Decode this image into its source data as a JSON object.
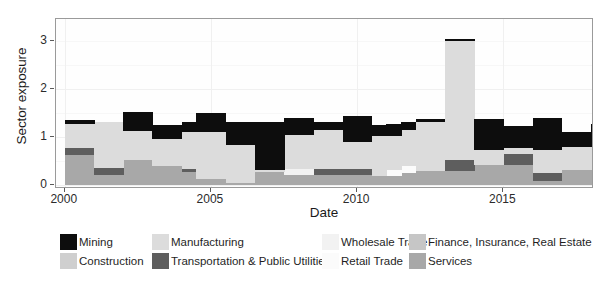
{
  "chart_data": {
    "type": "area",
    "title": "",
    "subtitle": "",
    "xlabel": "Date",
    "ylabel": "Sector exposure",
    "xlim": [
      1999.7,
      2018.1
    ],
    "ylim": [
      -0.08,
      3.45
    ],
    "yticks": [
      0,
      1,
      2,
      3
    ],
    "ytick_labels": [
      "0",
      "1",
      "2",
      "3"
    ],
    "xticks": [
      2000,
      2005,
      2010,
      2015
    ],
    "xtick_labels": [
      "2000",
      "2005",
      "2010",
      "2015"
    ],
    "grid": true,
    "legend_position": "bottom",
    "stacked": true,
    "step_interpolation": "step-post",
    "series": [
      {
        "name": "Services",
        "color": "#a8a8a8",
        "values": [
          0.62,
          0.62,
          0.22,
          0.22,
          0.52,
          0.52,
          0.4,
          0.4,
          0.28,
          0.12,
          0.12,
          0.04,
          0.04,
          0.28,
          0.28,
          0.22,
          0.22,
          0.22,
          0.22,
          0.22,
          0.22,
          0.18,
          0.18,
          0.25,
          0.3,
          0.3,
          0.3,
          0.3,
          0.42,
          0.42,
          0.42,
          0.42,
          0.08,
          0.08,
          0.32,
          0.32,
          0.32,
          0.32
        ]
      },
      {
        "name": "Transportation & Public Utilities",
        "color": "#5e5e5e",
        "values": [
          0.15,
          0.15,
          0.14,
          0.14,
          0.0,
          0.0,
          0.0,
          0.0,
          0.06,
          0.0,
          0.0,
          0.0,
          0.0,
          0.0,
          0.0,
          0.0,
          0.0,
          0.12,
          0.12,
          0.12,
          0.12,
          0.0,
          0.0,
          0.0,
          0.0,
          0.0,
          0.22,
          0.22,
          0.0,
          0.0,
          0.22,
          0.22,
          0.18,
          0.18,
          0.0,
          0.0,
          0.22,
          0.22
        ]
      },
      {
        "name": "Retail Trade",
        "color": "#fbfbfb",
        "values": [
          0.0,
          0.0,
          0.0,
          0.0,
          0.0,
          0.0,
          0.0,
          0.0,
          0.0,
          0.0,
          0.0,
          0.0,
          0.0,
          0.0,
          0.0,
          0.0,
          0.0,
          0.0,
          0.0,
          0.0,
          0.0,
          0.0,
          0.14,
          0.14,
          0.0,
          0.0,
          0.0,
          0.0,
          0.0,
          0.0,
          0.0,
          0.0,
          0.0,
          0.0,
          0.0,
          0.0,
          0.0,
          0.0
        ]
      },
      {
        "name": "Wholesale Trade",
        "color": "#f2f2f2",
        "values": [
          0.0,
          0.0,
          0.0,
          0.0,
          0.0,
          0.0,
          0.0,
          0.0,
          0.0,
          0.0,
          0.0,
          0.0,
          0.0,
          0.0,
          0.0,
          0.12,
          0.12,
          0.0,
          0.0,
          0.0,
          0.0,
          0.0,
          0.0,
          0.0,
          0.0,
          0.0,
          0.0,
          0.0,
          0.0,
          0.0,
          0.0,
          0.0,
          0.0,
          0.0,
          0.0,
          0.0,
          0.0,
          0.0
        ]
      },
      {
        "name": "Finance, Insurance, Real Estate",
        "color": "#c6c6c6",
        "values": [
          0.0,
          0.0,
          0.0,
          0.0,
          0.0,
          0.0,
          0.0,
          0.0,
          0.0,
          0.0,
          0.0,
          0.0,
          0.0,
          0.0,
          0.0,
          0.0,
          0.0,
          0.0,
          0.0,
          0.0,
          0.0,
          0.0,
          0.0,
          0.0,
          0.0,
          0.0,
          0.0,
          0.0,
          0.0,
          0.0,
          0.0,
          0.0,
          0.0,
          0.0,
          0.0,
          0.0,
          0.0,
          0.0
        ]
      },
      {
        "name": "Construction",
        "color": "#cfcfcf",
        "values": [
          0.0,
          0.0,
          0.0,
          0.0,
          0.0,
          0.0,
          0.0,
          0.0,
          0.0,
          0.0,
          0.0,
          0.0,
          0.0,
          0.0,
          0.0,
          0.0,
          0.0,
          0.0,
          0.0,
          0.0,
          0.0,
          0.0,
          0.0,
          0.0,
          0.0,
          0.0,
          0.0,
          0.0,
          0.0,
          0.0,
          0.0,
          0.0,
          0.0,
          0.0,
          0.0,
          0.0,
          0.0,
          0.0
        ]
      },
      {
        "name": "Manufacturing",
        "color": "#dcdcdc",
        "values": [
          0.5,
          0.5,
          0.96,
          0.96,
          0.6,
          0.6,
          0.55,
          0.55,
          0.76,
          0.98,
          0.98,
          0.8,
          0.8,
          0.04,
          0.04,
          0.7,
          0.7,
          0.8,
          0.8,
          0.55,
          0.55,
          0.85,
          0.7,
          0.75,
          1.02,
          1.02,
          2.48,
          2.48,
          0.3,
          0.3,
          0.14,
          0.14,
          0.48,
          0.48,
          0.48,
          0.48,
          0.28,
          0.28
        ]
      },
      {
        "name": "Mining",
        "color": "#0d0d0d",
        "values": [
          0.08,
          0.08,
          0.0,
          0.0,
          0.4,
          0.4,
          0.3,
          0.3,
          0.22,
          0.4,
          0.4,
          0.48,
          0.48,
          1.0,
          1.0,
          0.36,
          0.36,
          0.18,
          0.18,
          0.54,
          0.54,
          0.22,
          0.24,
          0.18,
          0.06,
          0.06,
          0.04,
          0.04,
          0.65,
          0.65,
          0.45,
          0.45,
          0.66,
          0.66,
          0.3,
          0.3,
          0.46,
          0.46
        ]
      }
    ],
    "x": [
      2000.0,
      2000.5,
      2001.0,
      2001.5,
      2002.0,
      2002.5,
      2003.0,
      2003.5,
      2004.0,
      2004.5,
      2005.0,
      2005.5,
      2006.0,
      2006.5,
      2007.0,
      2007.5,
      2008.0,
      2008.5,
      2009.0,
      2009.5,
      2010.0,
      2010.5,
      2011.0,
      2011.5,
      2012.0,
      2012.5,
      2013.0,
      2013.5,
      2014.0,
      2014.5,
      2015.0,
      2015.5,
      2016.0,
      2016.5,
      2017.0,
      2017.5,
      2018.0,
      2018.1
    ]
  },
  "legend": {
    "items": [
      {
        "label": "Mining",
        "color": "#0d0d0d",
        "col": 0,
        "row": 0
      },
      {
        "label": "Construction",
        "color": "#cfcfcf",
        "col": 0,
        "row": 1
      },
      {
        "label": "Manufacturing",
        "color": "#dcdcdc",
        "col": 1,
        "row": 0
      },
      {
        "label": "Transportation & Public Utilities",
        "color": "#5e5e5e",
        "col": 1,
        "row": 1
      },
      {
        "label": "Wholesale Trade",
        "color": "#f2f2f2",
        "col": 2,
        "row": 0
      },
      {
        "label": "Retail Trade",
        "color": "#fbfbfb",
        "col": 2,
        "row": 1
      },
      {
        "label": "Finance, Insurance, Real Estate",
        "color": "#c6c6c6",
        "col": 3,
        "row": 0
      },
      {
        "label": "Services",
        "color": "#a8a8a8",
        "col": 3,
        "row": 1
      }
    ]
  },
  "axes": {
    "y_title": "Sector exposure",
    "x_title": "Date"
  }
}
